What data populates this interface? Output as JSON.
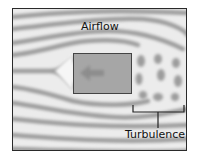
{
  "diagram": {
    "labels": {
      "airflow": "Airflow",
      "turbulence": "Turbulence"
    },
    "object": {
      "shape": "rectangle",
      "arrow_direction": "left",
      "color": "#a6a6a6"
    },
    "colors": {
      "background": "#e9e9e9",
      "stream_dark": "#9a9a9a",
      "stream_light": "#f4f4f4",
      "frame": "#2a2a2a"
    }
  }
}
